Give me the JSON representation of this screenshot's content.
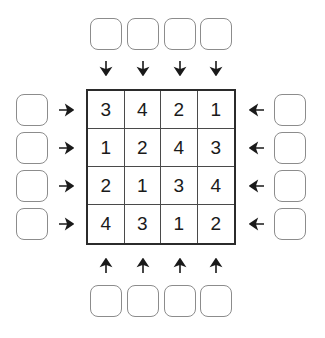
{
  "puzzle": {
    "type": "skyscrapers-4x4",
    "grid_size": 4,
    "grid": {
      "rows": [
        {
          "cells": [
            "3",
            "4",
            "2",
            "1"
          ]
        },
        {
          "cells": [
            "1",
            "2",
            "4",
            "3"
          ]
        },
        {
          "cells": [
            "2",
            "1",
            "3",
            "4"
          ]
        },
        {
          "cells": [
            "4",
            "3",
            "1",
            "2"
          ]
        }
      ]
    },
    "clues": {
      "top": {
        "direction": "down",
        "arrow_icon": "arrow-down-icon",
        "values": [
          "",
          "",
          "",
          ""
        ]
      },
      "bottom": {
        "direction": "up",
        "arrow_icon": "arrow-up-icon",
        "values": [
          "",
          "",
          "",
          ""
        ]
      },
      "left": {
        "direction": "right",
        "arrow_icon": "arrow-right-icon",
        "values": [
          "",
          "",
          "",
          ""
        ]
      },
      "right": {
        "direction": "left",
        "arrow_icon": "arrow-left-icon",
        "values": [
          "",
          "",
          "",
          ""
        ]
      }
    },
    "colors": {
      "background": "#ffffff",
      "grid_outer_border": "#2b2b2b",
      "grid_inner_line": "#4a4a4a",
      "clue_box_border": "#8c8c8c",
      "digit_color": "#1a1a1a",
      "arrow_color": "#1a1a1a"
    }
  }
}
